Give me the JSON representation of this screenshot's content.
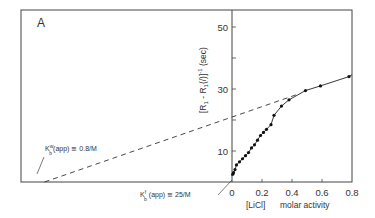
{
  "panel_label": "A",
  "chart_data": {
    "type": "scatter",
    "title": "",
    "panel": "A",
    "xlabel": "[LiCl]  molar activity",
    "xlabel_parts": {
      "bracket": "[LiCl]",
      "text": "molar activity"
    },
    "ylabel": "[R1 - R1(/)]^-1 (sec)",
    "x_ticks": [
      0,
      0.2,
      0.4,
      0.6,
      0.8
    ],
    "x_tick_labels": [
      "0",
      "0.2",
      "0.4",
      "0.6",
      "0.8"
    ],
    "y_ticks": [
      0,
      10,
      20,
      30,
      40,
      50
    ],
    "y_tick_labels": [
      "",
      "10",
      "",
      "30",
      "",
      "50"
    ],
    "xlim": [
      -1.3,
      0.8
    ],
    "ylim": [
      0,
      56
    ],
    "grid": false,
    "series": [
      {
        "name": "measured",
        "style": "points-with-line",
        "x": [
          0.005,
          0.01,
          0.02,
          0.03,
          0.05,
          0.07,
          0.09,
          0.11,
          0.13,
          0.15,
          0.17,
          0.19,
          0.21,
          0.23,
          0.26,
          0.28,
          0.33,
          0.38,
          0.49,
          0.59,
          0.78
        ],
        "y": [
          2.5,
          3.0,
          4.0,
          5.5,
          6.5,
          7.5,
          8.5,
          9.5,
          11.0,
          12.0,
          13.5,
          15.0,
          16.0,
          17.0,
          18.5,
          21.5,
          24.5,
          26.5,
          29.5,
          31.0,
          34.0
        ]
      },
      {
        "name": "extrapolation",
        "style": "dashed",
        "x": [
          -1.25,
          0.45
        ],
        "y": [
          0,
          28.5
        ]
      }
    ],
    "annotations": [
      {
        "text_k": "K",
        "sup": "w",
        "sub": "b",
        "text": "(app) = 0.8/M",
        "points_to": [
          -1.25,
          0
        ]
      },
      {
        "text_k": "K",
        "sup": "f",
        "sub": "b",
        "text": "(app) = 25/M",
        "points_to": [
          -0.04,
          0
        ]
      }
    ]
  }
}
